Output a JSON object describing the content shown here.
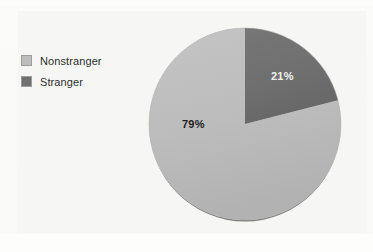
{
  "figure": {
    "background_color": "#fdfdfc",
    "panel_color": "#f6f6f4"
  },
  "legend": {
    "position": "top-left",
    "items": [
      {
        "label": "Nonstranger",
        "color": "#bdbdbd",
        "swatch_name": "legend-swatch-nonstranger"
      },
      {
        "label": "Stranger",
        "color": "#707070",
        "swatch_name": "legend-swatch-stranger"
      }
    ]
  },
  "chart_data": {
    "type": "pie",
    "title": "",
    "subtitle": "",
    "xlabel": "",
    "ylabel": "",
    "categories": [
      "Nonstranger",
      "Stranger"
    ],
    "values": [
      79,
      21
    ],
    "value_unit": "percent",
    "data_labels": [
      "79%",
      "21%"
    ],
    "colors": [
      "#bdbdbd",
      "#707070"
    ],
    "start_angle_deg": 0,
    "direction": "clockwise",
    "legend_position": "top-left",
    "grid": false,
    "has_shadow_edge": true,
    "slices": [
      {
        "name": "Nonstranger",
        "value": 79,
        "label": "79%",
        "color": "#bdbdbd",
        "label_color": "#1f1f1f",
        "sweep_deg": 284.4,
        "label_x": 182,
        "label_y": 118
      },
      {
        "name": "Stranger",
        "value": 21,
        "label": "21%",
        "color": "#707070",
        "label_color": "#f2f2f2",
        "sweep_deg": 75.6,
        "label_x": 271,
        "label_y": 70
      }
    ],
    "geometry": {
      "center_x": 245,
      "center_y": 124,
      "radius": 96,
      "shadow_color": "#5f5f5f"
    }
  }
}
